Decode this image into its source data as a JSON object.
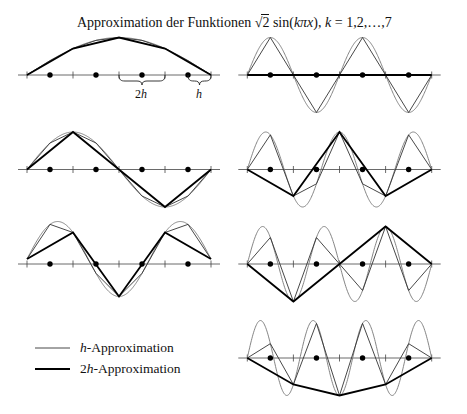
{
  "title": {
    "prefix": "Approximation der Funktionen ",
    "sqrt_sign": "√",
    "sqrt_arg": "2",
    "func_open": " sin(",
    "func_arg": "kπx",
    "func_close": "), ",
    "index_var": "k",
    "index_range": " = 1,2,…,7"
  },
  "annotations": {
    "two_h": {
      "num": "2",
      "var": "h"
    },
    "h": {
      "var": "h"
    }
  },
  "legend": [
    {
      "symbol": "thin-line",
      "var": "h",
      "label": "-Approximation"
    },
    {
      "symbol": "thick-line",
      "prefix": "2",
      "var": "h",
      "label": "-Approximation"
    }
  ],
  "colors": {
    "exact_curve": "#777777",
    "h_approximation": "#333333",
    "two_h_approximation": "#000000",
    "axis": "#444444",
    "nodes": "#000000"
  },
  "chart_data": {
    "type": "line",
    "title": "Approximation der Funktionen √2 sin(kπx), k = 1,2,…,7",
    "xlabel": "",
    "ylabel": "",
    "x_range": [
      0,
      1
    ],
    "y_range": [
      -1.414,
      1.414
    ],
    "grid": false,
    "h": 0.125,
    "fine_nodes": [
      0,
      0.125,
      0.25,
      0.375,
      0.5,
      0.625,
      0.75,
      0.875,
      1
    ],
    "coarse_nodes": [
      0,
      0.25,
      0.5,
      0.75,
      1
    ],
    "series": [
      {
        "name": "√2 sin(kπx)",
        "style": "thin gray curve"
      },
      {
        "name": "h-Approximation",
        "style": "thin line"
      },
      {
        "name": "2h-Approximation",
        "style": "thick line"
      }
    ],
    "legend": {
      "position": "bottom-left",
      "entries": [
        "h-Approximation",
        "2h-Approximation"
      ]
    },
    "brace_annotations": [
      {
        "label": "2h",
        "from": 0.5,
        "to": 0.75,
        "panel_k": 1
      },
      {
        "label": "h",
        "from": 0.875,
        "to": 1,
        "panel_k": 1
      }
    ],
    "panels": [
      {
        "k": 1,
        "row": 1,
        "col": "left",
        "h_values": [
          0,
          0.541,
          1,
          1.307,
          1.414,
          1.307,
          1,
          0.541,
          0
        ],
        "2h_values": [
          0,
          1,
          1.414,
          1,
          0
        ]
      },
      {
        "k": 4,
        "row": 1,
        "col": "right",
        "h_values": [
          0,
          1.414,
          0,
          -1.414,
          0,
          1.414,
          0,
          -1.414,
          0
        ],
        "2h_values": [
          0,
          0,
          0,
          0,
          0
        ]
      },
      {
        "k": 2,
        "row": 2,
        "col": "left",
        "h_values": [
          0,
          1,
          1.414,
          1,
          0,
          -1,
          -1.414,
          -1,
          0
        ],
        "2h_values": [
          0,
          1.414,
          0,
          -1.414,
          0
        ]
      },
      {
        "k": 5,
        "row": 2,
        "col": "right",
        "h_values": [
          0,
          1.307,
          -1,
          -0.541,
          1.414,
          -0.541,
          -1,
          1.307,
          0
        ],
        "2h_values": [
          0,
          -1,
          1.414,
          -1,
          0
        ]
      },
      {
        "k": 3,
        "row": 3,
        "col": "left",
        "h_values": [
          0,
          1.307,
          1,
          -0.541,
          -1.414,
          -0.541,
          1,
          1.307,
          0
        ],
        "2h_values": [
          0,
          1,
          -1.414,
          1,
          0
        ]
      },
      {
        "k": 6,
        "row": 3,
        "col": "right",
        "h_values": [
          0,
          1,
          -1.414,
          1,
          0,
          -1,
          1.414,
          -1,
          0
        ],
        "2h_values": [
          0,
          -1.414,
          0,
          1.414,
          0
        ]
      },
      {
        "k": 7,
        "row": 4,
        "col": "right",
        "h_values": [
          0,
          0.541,
          -1,
          1.307,
          -1.414,
          1.307,
          -1,
          0.541,
          0
        ],
        "2h_values": [
          0,
          -1,
          -1.414,
          -1,
          0
        ]
      }
    ]
  }
}
